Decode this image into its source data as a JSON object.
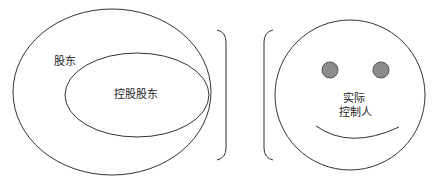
{
  "left_diagram": {
    "outer_label": "股东",
    "inner_label": "控股股东"
  },
  "right_diagram": {
    "face_label_line1": "实际",
    "face_label_line2": "控制人"
  },
  "colors": {
    "stroke": "#333333",
    "eye_fill": "#8c8c8c",
    "background": "#ffffff"
  }
}
